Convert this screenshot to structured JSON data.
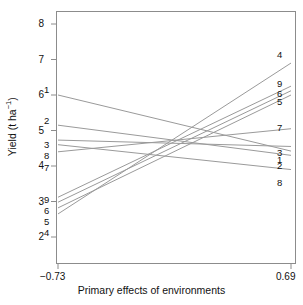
{
  "figure": {
    "background": "#ffffff",
    "frame_color": "#8c8c8c",
    "line_color": "#9a9a9a",
    "text_color": "#111111"
  },
  "axes": {
    "y_title_main": "Yield (t ha",
    "y_title_sup": "−1",
    "y_title_tail": ")",
    "x_title": "Primary effects of environments",
    "y_ticks": [
      "2",
      "3",
      "4",
      "5",
      "6",
      "7",
      "8"
    ],
    "x_ticks": [
      "−0.73",
      "0.69"
    ]
  },
  "chart_data": {
    "type": "line",
    "title": "",
    "xlabel": "Primary effects of environments",
    "ylabel": "Yield (t ha-1)",
    "xlim": [
      -0.73,
      0.69
    ],
    "ylim": [
      1.65,
      8.4
    ],
    "x": [
      -0.73,
      0.69
    ],
    "xtick_values": [
      -0.73,
      0.69
    ],
    "ytick_values": [
      2,
      3,
      4,
      5,
      6,
      7,
      8
    ],
    "grid": false,
    "legend": "endpoint-labels",
    "convergence_point": [
      -0.02,
      4.65
    ],
    "series": [
      {
        "name": "1",
        "label": "1",
        "values": [
          6.0,
          4.42
        ]
      },
      {
        "name": "2",
        "label": "2",
        "values": [
          5.15,
          4.3
        ]
      },
      {
        "name": "3",
        "label": "3",
        "values": [
          4.73,
          4.55
        ]
      },
      {
        "name": "4",
        "label": "4",
        "values": [
          2.65,
          6.9
        ]
      },
      {
        "name": "5",
        "label": "5",
        "values": [
          2.82,
          6.0
        ]
      },
      {
        "name": "6",
        "label": "6",
        "values": [
          2.98,
          6.12
        ]
      },
      {
        "name": "7",
        "label": "7",
        "values": [
          4.4,
          5.05
        ]
      },
      {
        "name": "8",
        "label": "8",
        "values": [
          4.6,
          3.9
        ]
      },
      {
        "name": "9",
        "label": "9",
        "values": [
          3.12,
          6.25
        ]
      }
    ],
    "left_label_order": [
      "1",
      "2",
      "3",
      "8",
      "7",
      "9",
      "6",
      "5",
      "4"
    ],
    "right_label_order": [
      "4",
      "9",
      "6",
      "5",
      "7",
      "3",
      "1",
      "2",
      "8"
    ]
  },
  "labels": {
    "left": [
      {
        "text": "1",
        "x": 44,
        "y": 85
      },
      {
        "text": "2",
        "x": 44,
        "y": 116
      },
      {
        "text": "3",
        "x": 44,
        "y": 140
      },
      {
        "text": "8",
        "x": 44,
        "y": 151
      },
      {
        "text": "7",
        "x": 44,
        "y": 163
      },
      {
        "text": "9",
        "x": 44,
        "y": 195
      },
      {
        "text": "6",
        "x": 44,
        "y": 206
      },
      {
        "text": "5",
        "x": 44,
        "y": 217
      },
      {
        "text": "4",
        "x": 44,
        "y": 228
      }
    ],
    "right": [
      {
        "text": "4",
        "x": 277,
        "y": 50
      },
      {
        "text": "9",
        "x": 277,
        "y": 79
      },
      {
        "text": "6",
        "x": 277,
        "y": 89
      },
      {
        "text": "5",
        "x": 277,
        "y": 97
      },
      {
        "text": "7",
        "x": 277,
        "y": 123
      },
      {
        "text": "3",
        "x": 277,
        "y": 148
      },
      {
        "text": "1",
        "x": 277,
        "y": 155
      },
      {
        "text": "2",
        "x": 277,
        "y": 161
      },
      {
        "text": "8",
        "x": 277,
        "y": 178
      }
    ]
  }
}
